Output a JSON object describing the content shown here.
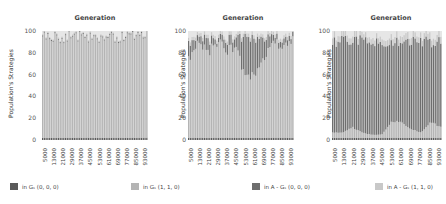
{
  "chart_data": [
    {
      "type": "bar",
      "title": "Generation",
      "xlabel": "",
      "ylabel": "Population's Strategies",
      "ylim": [
        0,
        100
      ],
      "yticks": [
        0,
        20,
        40,
        60,
        80,
        100
      ],
      "categories": [
        "5000",
        "13000",
        "21000",
        "29000",
        "37000",
        "45000",
        "53000",
        "61000",
        "69000",
        "77000",
        "85000",
        "93000"
      ],
      "stacked": true,
      "series": [
        {
          "name": "in Gs (0, 0, 0)",
          "values": [
            2,
            2,
            2,
            2,
            2,
            2,
            2,
            2,
            2,
            2,
            2,
            2
          ]
        },
        {
          "name": "in Gs (1, 1, 0)",
          "values": [
            94,
            95,
            94,
            95,
            94,
            95,
            94,
            95,
            94,
            95,
            94,
            95
          ]
        },
        {
          "name": "in A - Gs (0, 0, 0)",
          "values": [
            1,
            1,
            1,
            1,
            1,
            1,
            1,
            1,
            1,
            1,
            1,
            1
          ]
        },
        {
          "name": "in A - Gs (1, 1, 0)",
          "values": [
            1,
            1,
            1,
            1,
            1,
            1,
            1,
            1,
            1,
            1,
            1,
            1
          ]
        }
      ]
    },
    {
      "type": "bar",
      "title": "Generation",
      "xlabel": "",
      "ylabel": "Population's Strategies",
      "ylim": [
        0,
        100
      ],
      "yticks": [
        0,
        20,
        40,
        60,
        80,
        100
      ],
      "categories": [
        "5000",
        "13000",
        "21000",
        "29000",
        "37000",
        "45000",
        "53000",
        "61000",
        "69000",
        "77000",
        "85000",
        "93000"
      ],
      "stacked": true,
      "series": [
        {
          "name": "in Gs (0, 0, 0)",
          "values": [
            2,
            2,
            2,
            2,
            2,
            2,
            2,
            2,
            2,
            2,
            2,
            2
          ]
        },
        {
          "name": "in Gs (1, 1, 0)",
          "values": [
            75,
            88,
            80,
            90,
            82,
            85,
            55,
            60,
            75,
            88,
            86,
            90
          ]
        },
        {
          "name": "in A - Gs (0, 0, 0)",
          "values": [
            15,
            5,
            12,
            3,
            10,
            8,
            38,
            33,
            18,
            5,
            6,
            4
          ]
        },
        {
          "name": "in A - Gs (1, 1, 0)",
          "values": [
            3,
            3,
            3,
            3,
            3,
            3,
            3,
            3,
            3,
            3,
            3,
            3
          ]
        }
      ]
    },
    {
      "type": "bar",
      "title": "Generation",
      "xlabel": "",
      "ylabel": "Population's Strategies",
      "ylim": [
        0,
        100
      ],
      "yticks": [
        0,
        20,
        40,
        60,
        80,
        100
      ],
      "categories": [
        "5000",
        "13000",
        "21000",
        "29000",
        "37000",
        "45000",
        "53000",
        "61000",
        "69000",
        "77000",
        "85000",
        "93000"
      ],
      "stacked": true,
      "series": [
        {
          "name": "in Gs (0, 0, 0)",
          "values": [
            2,
            2,
            2,
            2,
            2,
            2,
            2,
            2,
            2,
            2,
            2,
            2
          ]
        },
        {
          "name": "in Gs (1, 1, 0)",
          "values": [
            5,
            5,
            10,
            5,
            3,
            3,
            15,
            15,
            8,
            5,
            15,
            10
          ]
        },
        {
          "name": "in A - Gs (0, 0, 0)",
          "values": [
            85,
            86,
            80,
            86,
            88,
            88,
            75,
            75,
            82,
            86,
            75,
            80
          ]
        },
        {
          "name": "in A - Gs (1, 1, 0)",
          "values": [
            6,
            5,
            6,
            5,
            5,
            5,
            6,
            6,
            6,
            5,
            6,
            6
          ]
        }
      ]
    }
  ],
  "panels": [
    {
      "title": "Generation",
      "ylabel": "Population's Strategies"
    },
    {
      "title": "Generation",
      "ylabel": "Population's Strategies"
    },
    {
      "title": "Generation",
      "ylabel": "Population's Strategies"
    }
  ],
  "yticks": [
    "100",
    "80",
    "60",
    "40",
    "20",
    "0"
  ],
  "xticks": [
    "5000",
    "13000",
    "21000",
    "29000",
    "37000",
    "45000",
    "53000",
    "61000",
    "69000",
    "77000",
    "85000",
    "93000"
  ],
  "legend": [
    {
      "label": "in Gₛ (0, 0, 0)",
      "color": "#5a5a5a"
    },
    {
      "label": "in Gₛ (1, 1, 0)",
      "color": "#b4b4b4"
    },
    {
      "label": "in A - Gₛ (0, 0, 0)",
      "color": "#6e6e6e"
    },
    {
      "label": "in A - Gₛ (1, 1, 0)",
      "color": "#c8c8c8"
    }
  ]
}
